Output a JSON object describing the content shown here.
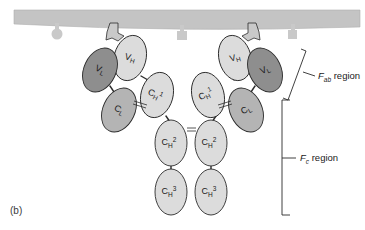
{
  "figure": {
    "panel_label": "(b)",
    "background_color": "#ffffff"
  },
  "membrane": {
    "name": "cell-membrane-bar",
    "color": "#c4c4c4",
    "stroke": "#b0b0b0"
  },
  "antigens": [
    {
      "id": "antigen-round-left",
      "shape": "round",
      "color": "#c9c9c9",
      "x": 57,
      "y": 30
    },
    {
      "id": "antigen-bound-left",
      "shape": "wedge",
      "color": "#c9c9c9",
      "x": 113,
      "y": 33
    },
    {
      "id": "antigen-square-center",
      "shape": "square",
      "color": "#c9c9c9",
      "x": 182,
      "y": 34
    },
    {
      "id": "antigen-bound-right",
      "shape": "wedge",
      "color": "#c9c9c9",
      "x": 253,
      "y": 33
    },
    {
      "id": "antigen-square-right",
      "shape": "square",
      "color": "#c9c9c9",
      "x": 293,
      "y": 33
    }
  ],
  "domains": {
    "colors": {
      "variable_light": "#8e8e8e",
      "constant_light": "#b4b4b4",
      "heavy": "#dcdcdc"
    },
    "left_arm": [
      {
        "name": "domain-vl-left",
        "label": "V",
        "sub": "L",
        "sup": "",
        "fill": "#8e8e8e",
        "cx": 100,
        "cy": 70,
        "rx": 16,
        "ry": 23,
        "rot": 25
      },
      {
        "name": "domain-vh-left",
        "label": "V",
        "sub": "H",
        "sup": "",
        "fill": "#dcdcdc",
        "cx": 130,
        "cy": 58,
        "rx": 16,
        "ry": 23,
        "rot": 15
      },
      {
        "name": "domain-cl-left",
        "label": "C",
        "sub": "L",
        "sup": "",
        "fill": "#b4b4b4",
        "cx": 119,
        "cy": 110,
        "rx": 16,
        "ry": 23,
        "rot": 25
      },
      {
        "name": "domain-ch1-left",
        "label": "C",
        "sub": "H",
        "sup": "1",
        "fill": "#dcdcdc",
        "cx": 157,
        "cy": 95,
        "rx": 16,
        "ry": 23,
        "rot": 15
      }
    ],
    "right_arm": [
      {
        "name": "domain-vl-right",
        "label": "V",
        "sub": "L",
        "sup": "",
        "fill": "#8e8e8e",
        "cx": 265,
        "cy": 70,
        "rx": 16,
        "ry": 23,
        "rot": -25
      },
      {
        "name": "domain-vh-right",
        "label": "V",
        "sub": "H",
        "sup": "",
        "fill": "#dcdcdc",
        "cx": 235,
        "cy": 58,
        "rx": 16,
        "ry": 23,
        "rot": -15
      },
      {
        "name": "domain-cl-right",
        "label": "C",
        "sub": "L",
        "sup": "",
        "fill": "#b4b4b4",
        "cx": 246,
        "cy": 110,
        "rx": 16,
        "ry": 23,
        "rot": -25
      },
      {
        "name": "domain-ch1-right",
        "label": "C",
        "sub": "H",
        "sup": "1",
        "fill": "#dcdcdc",
        "cx": 208,
        "cy": 95,
        "rx": 16,
        "ry": 23,
        "rot": -15
      }
    ],
    "stem": [
      {
        "name": "domain-ch2-left",
        "label": "C",
        "sub": "H",
        "sup": "2",
        "fill": "#dcdcdc",
        "cx": 171,
        "cy": 143,
        "rx": 16,
        "ry": 23,
        "rot": 0
      },
      {
        "name": "domain-ch2-right",
        "label": "C",
        "sub": "H",
        "sup": "2",
        "fill": "#dcdcdc",
        "cx": 211,
        "cy": 143,
        "rx": 16,
        "ry": 23,
        "rot": 0
      },
      {
        "name": "domain-ch3-left",
        "label": "C",
        "sub": "H",
        "sup": "3",
        "fill": "#dcdcdc",
        "cx": 171,
        "cy": 192,
        "rx": 16,
        "ry": 23,
        "rot": 0
      },
      {
        "name": "domain-ch3-right",
        "label": "C",
        "sub": "H",
        "sup": "3",
        "fill": "#dcdcdc",
        "cx": 211,
        "cy": 192,
        "rx": 16,
        "ry": 23,
        "rot": 0
      }
    ]
  },
  "region_labels": {
    "fab": {
      "prefix": "F",
      "sub": "ab",
      "suffix": " region"
    },
    "fc": {
      "prefix": "F",
      "sub": "c",
      "suffix": " region"
    }
  }
}
